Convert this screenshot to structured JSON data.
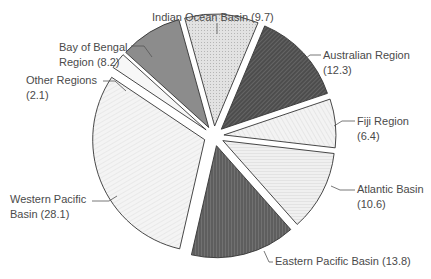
{
  "chart_data": {
    "type": "pie",
    "title": "",
    "exploded": true,
    "start_angle_deg": -15.5,
    "direction": "clockwise",
    "slices": [
      {
        "label": "Indian Ocean Basin",
        "value": 9.7,
        "display": "Indian Ocean Basin (9.7)",
        "fill": "#d9d9d9",
        "pattern": "dots",
        "text_lines": [
          "Indian Ocean Basin (9.7)"
        ],
        "text_pos": [
          152,
          21
        ],
        "anchor": "start",
        "leader": [
          [
            217,
            34
          ],
          [
            217,
            23
          ]
        ]
      },
      {
        "label": "Australian Region",
        "value": 12.3,
        "display": "Australian Region (12.3)",
        "fill": "#555555",
        "pattern": "diag-dense",
        "text_lines": [
          "Australian Region",
          "(12.3)"
        ],
        "text_pos": [
          323,
          59
        ],
        "anchor": "start",
        "leader": [
          [
            301,
            62
          ],
          [
            310,
            55
          ],
          [
            321,
            55
          ]
        ]
      },
      {
        "label": "Fiji Region",
        "value": 6.4,
        "display": "Fiji Region (6.4)",
        "fill": "#f0f0f0",
        "pattern": "diag-light",
        "text_lines": [
          "Fiji Region",
          "(6.4)"
        ],
        "text_pos": [
          357,
          125
        ],
        "anchor": "start",
        "leader": [
          [
            334,
            126
          ],
          [
            342,
            121
          ],
          [
            355,
            121
          ]
        ]
      },
      {
        "label": "Atlantic Basin",
        "value": 10.6,
        "display": "Atlantic Basin (10.6)",
        "fill": "#ededed",
        "pattern": "horiz",
        "text_lines": [
          "Atlantic Basin",
          "(10.6)"
        ],
        "text_pos": [
          357,
          193
        ],
        "anchor": "start",
        "leader": [
          [
            331,
            186
          ],
          [
            340,
            190
          ],
          [
            355,
            190
          ]
        ]
      },
      {
        "label": "Eastern Pacific Basin",
        "value": 13.8,
        "display": "Eastern Pacific Basin (13.8)",
        "fill": "#666666",
        "pattern": "vert",
        "text_lines": [
          "Eastern Pacific Basin (13.8)"
        ],
        "text_pos": [
          275,
          265
        ],
        "anchor": "start",
        "leader": [
          [
            264,
            251
          ],
          [
            269,
            262
          ],
          [
            273,
            262
          ]
        ]
      },
      {
        "label": "Western Pacific Basin",
        "value": 28.1,
        "display": "Western Pacific Basin (28.1)",
        "fill": "#f2f2f2",
        "pattern": "diag-light2",
        "text_lines": [
          "Western Pacific",
          "Basin (28.1)"
        ],
        "text_pos": [
          10,
          203
        ],
        "anchor": "start",
        "leader": [
          [
            117,
            196
          ],
          [
            109,
            201
          ],
          [
            92,
            201
          ]
        ]
      },
      {
        "label": "Other Regions",
        "value": 2.1,
        "display": "Other Regions (2.1)",
        "fill": "#f7f7f7",
        "pattern": "none",
        "text_lines": [
          "Other Regions",
          "(2.1)"
        ],
        "text_pos": [
          26,
          84
        ],
        "anchor": "start",
        "leader": [
          [
            126,
            91
          ],
          [
            115,
            81
          ],
          [
            103,
            81
          ]
        ]
      },
      {
        "label": "Bay of Bengal Region",
        "value": 8.2,
        "display": "Bay of Bengal Region (8.2)",
        "fill": "#8c8c8c",
        "pattern": "none",
        "text_lines": [
          "Bay of Bengal",
          "Region (8.2)"
        ],
        "text_pos": [
          59,
          51
        ],
        "anchor": "start",
        "leader": [
          [
            152,
            57
          ],
          [
            144,
            46
          ],
          [
            131,
            46
          ]
        ]
      }
    ],
    "total": 91.2,
    "center": [
      214,
      136
    ],
    "radius": 112,
    "explode_px": 10,
    "legend": "none",
    "xlabel": "",
    "ylabel": ""
  }
}
